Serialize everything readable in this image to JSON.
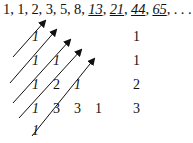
{
  "sequence": {
    "plain": [
      "1",
      "1",
      "2",
      "3",
      "5",
      "8"
    ],
    "underlined": [
      "13",
      "21",
      "44",
      "65"
    ],
    "ellipsis": ". . ."
  },
  "triangle": {
    "rows": [
      [
        "1"
      ],
      [
        "1",
        "1"
      ],
      [
        "1",
        "2",
        "1"
      ],
      [
        "1",
        "3",
        "3",
        "1"
      ],
      [
        "1"
      ]
    ]
  },
  "diagonal_sums": [
    "1",
    "1",
    "2",
    "3"
  ],
  "colors": {
    "ink": "#111111",
    "background": "#ffffff"
  }
}
